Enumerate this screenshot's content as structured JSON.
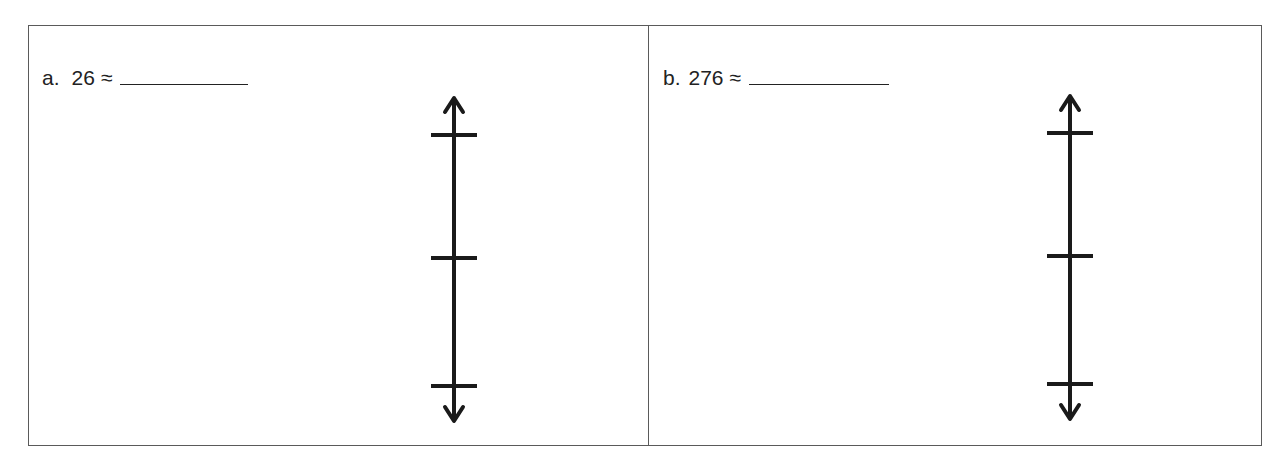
{
  "problems": [
    {
      "label": "a.",
      "number": "26",
      "symbol": "≈",
      "answer": "",
      "number_line_ticks": 3
    },
    {
      "label": "b.",
      "number": "276",
      "symbol": "≈",
      "answer": "",
      "number_line_ticks": 3
    }
  ],
  "colors": {
    "line": "#1a1a1a",
    "border": "#5a5a5a",
    "text": "#222222"
  }
}
